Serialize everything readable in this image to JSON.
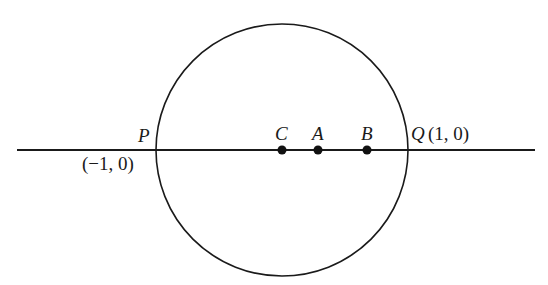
{
  "figure": {
    "circle": {
      "cx": 282,
      "cy": 150,
      "r": 126,
      "stroke": "#1a1a1a"
    },
    "axis_line": {
      "x1": 17,
      "x2": 535,
      "y": 150,
      "stroke": "#1a1a1a"
    },
    "points": [
      {
        "id": "C",
        "label": "C",
        "x": 282
      },
      {
        "id": "A",
        "label": "A",
        "x": 318
      },
      {
        "id": "B",
        "label": "B",
        "x": 367
      }
    ],
    "P": {
      "label": "P",
      "coords": "(−1, 0)"
    },
    "Q": {
      "label": "Q",
      "coords": "(1, 0)"
    }
  }
}
